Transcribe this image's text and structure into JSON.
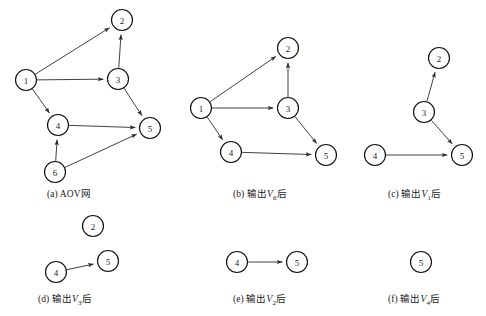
{
  "figure": {
    "background_color": "#ffffff",
    "node_fill": "#ffffff",
    "node_stroke": "#111111",
    "edge_color": "#2b2b2b",
    "node_radius": 10.5
  },
  "panels": [
    {
      "id": "a",
      "caption_prefix": "(a)",
      "caption_text": "AOV网",
      "caption_var": "",
      "caption_suffix": "",
      "caption_x": 47,
      "caption_y": 186,
      "nodes": [
        {
          "label": "1",
          "x": 26,
          "y": 80
        },
        {
          "label": "2",
          "x": 122,
          "y": 20
        },
        {
          "label": "3",
          "x": 118,
          "y": 79
        },
        {
          "label": "4",
          "x": 58,
          "y": 125
        },
        {
          "label": "5",
          "x": 150,
          "y": 128
        },
        {
          "label": "6",
          "x": 55,
          "y": 172
        }
      ],
      "edges": [
        {
          "from": "1",
          "to": "2"
        },
        {
          "from": "1",
          "to": "3"
        },
        {
          "from": "1",
          "to": "4"
        },
        {
          "from": "3",
          "to": "2"
        },
        {
          "from": "3",
          "to": "5"
        },
        {
          "from": "4",
          "to": "5"
        },
        {
          "from": "6",
          "to": "4"
        },
        {
          "from": "6",
          "to": "5"
        }
      ]
    },
    {
      "id": "b",
      "caption_prefix": "(b)",
      "caption_text": "输出",
      "caption_var": "V",
      "caption_sub": "6",
      "caption_suffix": "后",
      "caption_x": 233,
      "caption_y": 186,
      "nodes": [
        {
          "label": "1",
          "x": 201,
          "y": 108
        },
        {
          "label": "2",
          "x": 288,
          "y": 48
        },
        {
          "label": "3",
          "x": 288,
          "y": 108
        },
        {
          "label": "4",
          "x": 231,
          "y": 152
        },
        {
          "label": "5",
          "x": 326,
          "y": 155
        }
      ],
      "edges": [
        {
          "from": "1",
          "to": "2"
        },
        {
          "from": "1",
          "to": "3"
        },
        {
          "from": "1",
          "to": "4"
        },
        {
          "from": "3",
          "to": "2"
        },
        {
          "from": "3",
          "to": "5"
        },
        {
          "from": "4",
          "to": "5"
        }
      ]
    },
    {
      "id": "c",
      "caption_prefix": "(c)",
      "caption_text": "输出",
      "caption_var": "V",
      "caption_sub": "1",
      "caption_suffix": "后",
      "caption_x": 388,
      "caption_y": 186,
      "nodes": [
        {
          "label": "2",
          "x": 439,
          "y": 58
        },
        {
          "label": "3",
          "x": 424,
          "y": 112
        },
        {
          "label": "4",
          "x": 375,
          "y": 155
        },
        {
          "label": "5",
          "x": 462,
          "y": 155
        }
      ],
      "edges": [
        {
          "from": "3",
          "to": "2"
        },
        {
          "from": "3",
          "to": "5"
        },
        {
          "from": "4",
          "to": "5"
        }
      ]
    },
    {
      "id": "d",
      "caption_prefix": "(d)",
      "caption_text": "输出",
      "caption_var": "V",
      "caption_sub": "3",
      "caption_suffix": "后",
      "caption_x": 38,
      "caption_y": 291,
      "nodes": [
        {
          "label": "2",
          "x": 93,
          "y": 226
        },
        {
          "label": "4",
          "x": 56,
          "y": 272
        },
        {
          "label": "5",
          "x": 108,
          "y": 261
        }
      ],
      "edges": [
        {
          "from": "4",
          "to": "5"
        }
      ]
    },
    {
      "id": "e",
      "caption_prefix": "(e)",
      "caption_text": "输出",
      "caption_var": "V",
      "caption_sub": "2",
      "caption_suffix": "后",
      "caption_x": 233,
      "caption_y": 291,
      "nodes": [
        {
          "label": "4",
          "x": 237,
          "y": 262
        },
        {
          "label": "5",
          "x": 297,
          "y": 262
        }
      ],
      "edges": [
        {
          "from": "4",
          "to": "5"
        }
      ]
    },
    {
      "id": "f",
      "caption_prefix": "(f)",
      "caption_text": "输出",
      "caption_var": "V",
      "caption_sub": "4",
      "caption_suffix": "后",
      "caption_x": 388,
      "caption_y": 291,
      "nodes": [
        {
          "label": "5",
          "x": 421,
          "y": 262
        }
      ],
      "edges": []
    }
  ]
}
